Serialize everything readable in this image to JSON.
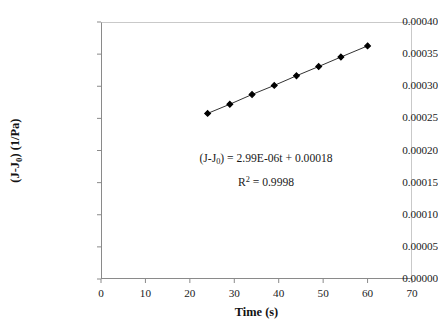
{
  "chart_data": {
    "type": "scatter",
    "title": "",
    "xlabel": "Time (s)",
    "ylabel": "(J-J0) (1/Pa)",
    "ylabel_parts": {
      "prefix": "(J-J",
      "sub": "0",
      "suffix": ") (1/Pa)"
    },
    "xlim": [
      0,
      70
    ],
    "ylim": [
      0,
      0.0004
    ],
    "grid": false,
    "legend": null,
    "x_ticks": [
      0,
      10,
      20,
      30,
      40,
      50,
      60,
      70
    ],
    "x_tick_labels": [
      "0",
      "10",
      "20",
      "30",
      "40",
      "50",
      "60",
      "70"
    ],
    "y_ticks": [
      0,
      5e-05,
      0.0001,
      0.00015,
      0.0002,
      0.00025,
      0.0003,
      0.00035,
      0.0004
    ],
    "y_tick_labels": [
      "0.00000",
      "0.00005",
      "0.00010",
      "0.00015",
      "0.00020",
      "0.00025",
      "0.00030",
      "0.00035",
      "0.00040"
    ],
    "series": [
      {
        "name": "creep compliance",
        "marker": "diamond",
        "marker_color": "#000000",
        "line_color": "#333333",
        "x": [
          24,
          29,
          34,
          39,
          44,
          49,
          54,
          60
        ],
        "y": [
          0.0002577,
          0.000272,
          0.0002872,
          0.0003013,
          0.0003163,
          0.0003307,
          0.0003455,
          0.0003628
        ]
      }
    ],
    "annotations": [
      {
        "name": "fit-equation",
        "line1_parts": {
          "prefix": "(J-J",
          "sub": "0",
          "suffix": ") = 2.99E-06t + 0.00018"
        },
        "line1_text": "(J-J0) = 2.99E-06t + 0.00018",
        "line2_base": "R",
        "line2_sup": "2",
        "line2_rest": " = 0.9998",
        "line2_text": "R2 = 0.9998",
        "slope": "2.99E-06",
        "intercept": "0.00018",
        "r_squared": "0.9998"
      }
    ],
    "colors": {
      "axis": "#8a8a8a",
      "frame_light": "#c9c9c9",
      "marker": "#000000",
      "line": "#333333",
      "text": "#1a1a1a",
      "background": "#ffffff"
    }
  }
}
